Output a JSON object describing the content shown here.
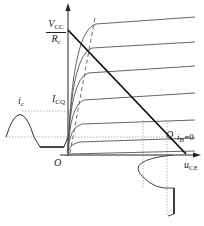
{
  "figure": {
    "type": "BJT output characteristics with DC load line and clipped output waveform",
    "labels": {
      "vcc_over_rc_num": "V",
      "vcc_over_rc_num_sub": "CC",
      "vcc_over_rc_den": "R",
      "vcc_over_rc_den_sub": "c",
      "ic_wave": "i",
      "ic_wave_sub": "c",
      "icq": "I",
      "icq_sub": "CQ",
      "origin": "O",
      "q_point": "Q",
      "ib_zero": "i",
      "ib_zero_sub": "B",
      "ib_zero_val": "=0",
      "uce_axis": "u",
      "uce_axis_sub": "CE"
    },
    "colors": {
      "line": "#222222",
      "curve": "#555555",
      "dotted": "#888888"
    }
  }
}
